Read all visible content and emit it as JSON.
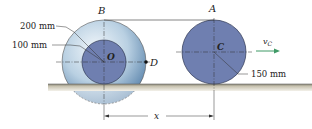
{
  "diagram": {
    "labels": {
      "point_B": "B",
      "point_A": "A",
      "point_O": "O",
      "point_C": "C",
      "point_D": "D",
      "outer_radius": "200 mm",
      "inner_radius": "100 mm",
      "wheel_radius": "150 mm",
      "velocity": "v",
      "velocity_sub": "C",
      "distance": "x"
    },
    "colors": {
      "wheel_fill": "#6f7fb0",
      "outer_disk_light": "#dfeaf3",
      "outer_disk_dark": "#6a93b8",
      "ground": "#b7b2a0",
      "arrow": "#3f9a66"
    }
  }
}
